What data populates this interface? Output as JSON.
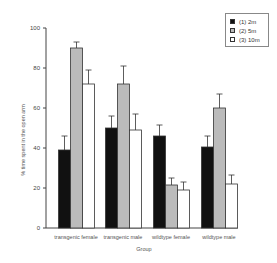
{
  "chart_data": {
    "type": "bar",
    "title": "",
    "xlabel": "Group",
    "ylabel": "% time spent in the open arm",
    "ylim": [
      0,
      100
    ],
    "yticks": [
      0,
      20,
      40,
      60,
      80,
      100
    ],
    "grid": false,
    "legend_position": "top-right",
    "categories": [
      "transgenic female",
      "transgenic male",
      "wildtype female",
      "wildtype male"
    ],
    "series": [
      {
        "name": "(1) 2m",
        "color": "#111111",
        "values": [
          39,
          50,
          46,
          40.5
        ],
        "error": [
          7,
          6,
          5.5,
          5.5
        ]
      },
      {
        "name": "(2) 5m",
        "color": "#bbbbbb",
        "values": [
          90,
          72,
          21.5,
          60
        ],
        "error": [
          3,
          9,
          3.5,
          7
        ]
      },
      {
        "name": "(3) 10m",
        "color": "#ffffff",
        "values": [
          72,
          49,
          19,
          22
        ],
        "error": [
          7,
          8,
          4,
          4.5
        ]
      }
    ]
  }
}
